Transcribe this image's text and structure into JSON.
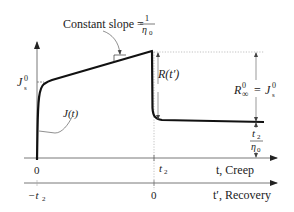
{
  "diagram": {
    "annotations": {
      "slope_label": "Constant slope =",
      "slope_num": "1",
      "slope_den": "η",
      "slope_den_sub": "0",
      "js0_main": "J",
      "js0_sup": "0",
      "js0_sub": "s",
      "jt_label": "J(t)",
      "rt_label": "R(t′)",
      "rinf_main": "R",
      "rinf_sup": "0",
      "rinf_sub": "∞",
      "rinf_eq": "=",
      "rinf_rhs_main": "J",
      "rinf_rhs_sup": "0",
      "rinf_rhs_sub": "s",
      "frac_num": "t",
      "frac_num_sub": "2",
      "frac_den": "η",
      "frac_den_sub": "0"
    },
    "axes": {
      "creep": {
        "origin_label": "0",
        "tick_label": "t",
        "tick_label_sub": "2",
        "axis_label": "t, Creep"
      },
      "recovery": {
        "origin_label": "−t",
        "origin_label_sub": "2",
        "tick_label": "0",
        "axis_label": "t′, Recovery"
      }
    }
  }
}
